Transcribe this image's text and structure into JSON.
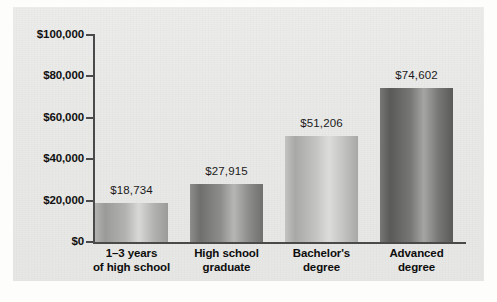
{
  "chart_data": {
    "type": "bar",
    "title": "",
    "xlabel": "",
    "ylabel": "",
    "ylim": [
      0,
      100000
    ],
    "grid": false,
    "legend": "none",
    "y_ticks": [
      {
        "value": 0,
        "label": "$0"
      },
      {
        "value": 20000,
        "label": "$20,000"
      },
      {
        "value": 40000,
        "label": "$40,000"
      },
      {
        "value": 60000,
        "label": "$60,000"
      },
      {
        "value": 80000,
        "label": "$80,000"
      },
      {
        "value": 100000,
        "label": "$100,000"
      }
    ],
    "categories": [
      "1–3 years of high school",
      "High school graduate",
      "Bachelor's degree",
      "Advanced degree"
    ],
    "values": [
      18734,
      27915,
      51206,
      74602
    ],
    "bars": [
      {
        "category_line1": "1–3 years",
        "category_line2": "of high school",
        "value": 18734,
        "value_label": "$18,734",
        "fill_light": "#d8d8d6",
        "fill_mid": "#b3b3b1",
        "fill_dark": "#9a9a98"
      },
      {
        "category_line1": "High school",
        "category_line2": "graduate",
        "value": 27915,
        "value_label": "$27,915",
        "fill_light": "#b6b6b4",
        "fill_mid": "#8d8d8b",
        "fill_dark": "#6f6f6d"
      },
      {
        "category_line1": "Bachelor's",
        "category_line2": "degree",
        "value": 51206,
        "value_label": "$51,206",
        "fill_light": "#dcdcda",
        "fill_mid": "#c3c3c1",
        "fill_dark": "#a8a8a6"
      },
      {
        "category_line1": "Advanced",
        "category_line2": "degree",
        "value": 74602,
        "value_label": "$74,602",
        "fill_light": "#a5a5a3",
        "fill_mid": "#777775",
        "fill_dark": "#5a5a58"
      }
    ],
    "colors": {
      "background": "#e9e9e7",
      "axis": "#4a4a4a",
      "text": "#111111"
    }
  }
}
